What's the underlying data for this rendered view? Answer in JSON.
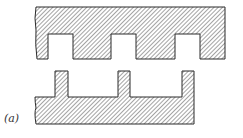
{
  "figure": {
    "label": "(a)",
    "colors": {
      "outline": "#2a2a2a",
      "hatch": "#4a4a4a",
      "background": "#ffffff"
    },
    "top_piece": {
      "path": "M36 7 L225 7 L225 59 L200 59 L200 34 L175 34 L175 59 L136 59 L136 34 L111 34 L111 59 L73 59 L73 34 L48 34 L48 59 L37 59 Q35 45 36 30 Q34 18 36 7 Z"
    },
    "bottom_piece": {
      "path": "M55 71 L68 71 L68 97 L118 97 L118 71 L130 71 L130 97 L182 97 L182 71 L194 71 L194 124 L36 124 Q34 112 36 108 Q35 102 35 97 L55 97 Z"
    }
  }
}
